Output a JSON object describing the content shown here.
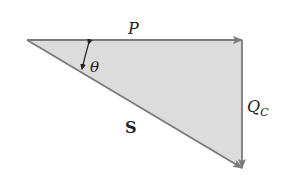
{
  "diagram": {
    "type": "power-triangle",
    "colors": {
      "fill": "#dcdcdc",
      "stroke": "#7a7a7a",
      "text": "#222222",
      "background": "#ffffff"
    },
    "vertices": {
      "origin": [
        27,
        40
      ],
      "corner": [
        242,
        40
      ],
      "tip": [
        242,
        168
      ]
    },
    "labels": {
      "real_power": "P",
      "reactive_power_main": "Q",
      "reactive_power_sub": "C",
      "apparent_power": "S",
      "angle": "θ"
    }
  }
}
